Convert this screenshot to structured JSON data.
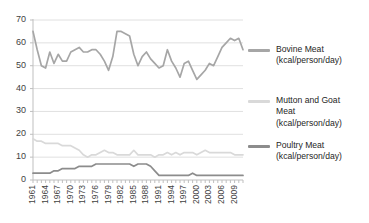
{
  "chart_data": {
    "type": "line",
    "title": "",
    "xlabel": "",
    "ylabel": "",
    "ylim": [
      0,
      70
    ],
    "ytick_labels": [
      "0",
      "10",
      "20",
      "30",
      "40",
      "50",
      "60",
      "70"
    ],
    "ytick_values": [
      0,
      10,
      20,
      30,
      40,
      50,
      60,
      70
    ],
    "grid": true,
    "grid_axis": "y",
    "legend_position": "right",
    "x": [
      1961,
      1962,
      1963,
      1964,
      1965,
      1966,
      1967,
      1968,
      1969,
      1970,
      1971,
      1972,
      1973,
      1974,
      1975,
      1976,
      1977,
      1978,
      1979,
      1980,
      1981,
      1982,
      1983,
      1984,
      1985,
      1986,
      1987,
      1988,
      1989,
      1990,
      1991,
      1992,
      1993,
      1994,
      1995,
      1996,
      1997,
      1998,
      1999,
      2000,
      2001,
      2002,
      2003,
      2004,
      2005,
      2006,
      2007,
      2008,
      2009,
      2010,
      2011
    ],
    "xtick_labels": [
      "1961",
      "1964",
      "1967",
      "1970",
      "1973",
      "1976",
      "1979",
      "1982",
      "1985",
      "1988",
      "1991",
      "1994",
      "1997",
      "2000",
      "2003",
      "2006",
      "2009"
    ],
    "xtick_values": [
      1961,
      1964,
      1967,
      1970,
      1973,
      1976,
      1979,
      1982,
      1985,
      1988,
      1991,
      1994,
      1997,
      2000,
      2003,
      2006,
      2009
    ],
    "series": [
      {
        "name": "Bovine Meat (kcal/person/day)",
        "legend_label": "Bovine Meat\n(kcal/person/day)",
        "color": "#a6a6a6",
        "values": [
          65,
          57,
          50,
          49,
          56,
          51,
          55,
          52,
          52,
          56,
          57,
          58,
          56,
          56,
          57,
          57,
          55,
          52,
          48,
          54,
          65,
          65,
          64,
          63,
          55,
          50,
          54,
          56,
          53,
          51,
          49,
          50,
          57,
          52,
          49,
          45,
          51,
          52,
          48,
          44,
          46,
          48,
          51,
          50,
          54,
          58,
          60,
          62,
          61,
          62,
          57
        ]
      },
      {
        "name": "Mutton and Goat Meat (kcal/person/day)",
        "legend_label": "Mutton and Goat\nMeat\n(kcal/person/day)",
        "color": "#d9d9d9",
        "values": [
          18,
          17,
          17,
          16,
          16,
          16,
          16,
          15,
          15,
          15,
          14,
          13,
          11,
          10,
          11,
          11,
          12,
          13,
          12,
          12,
          11,
          11,
          11,
          11,
          13,
          11,
          11,
          11,
          11,
          10,
          11,
          11,
          12,
          11,
          12,
          11,
          12,
          12,
          12,
          11,
          12,
          13,
          12,
          12,
          12,
          12,
          12,
          12,
          11,
          11,
          11
        ]
      },
      {
        "name": "Poultry Meat (kcal/person/day)",
        "legend_label": "Poultry Meat\n(kcal/person/day)",
        "color": "#8c8c8c",
        "values": [
          3,
          3,
          3,
          3,
          3,
          4,
          4,
          5,
          5,
          5,
          5,
          6,
          6,
          6,
          6,
          7,
          7,
          7,
          7,
          7,
          7,
          7,
          7,
          7,
          6,
          7,
          7,
          7,
          6,
          4,
          2,
          2,
          2,
          2,
          2,
          2,
          2,
          2,
          3,
          2,
          2,
          2,
          2,
          2,
          2,
          2,
          2,
          2,
          2,
          2,
          2
        ]
      }
    ]
  },
  "colors": {
    "axis": "#bfbfbf",
    "grid": "#e0e0e0",
    "tick_text": "#3f3f3f",
    "legend_text": "#262626",
    "background": "#ffffff"
  }
}
